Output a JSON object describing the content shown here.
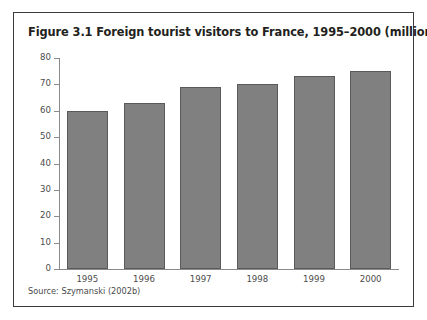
{
  "figure": {
    "title": "Figure 3.1 Foreign tourist visitors to France, 1995–2000 (millions)",
    "source": "Source: Szymanski (2002b)"
  },
  "chart_data": {
    "type": "bar",
    "title": "Figure 3.1 Foreign tourist visitors to France, 1995–2000 (millions)",
    "categories": [
      "1995",
      "1996",
      "1997",
      "1998",
      "1999",
      "2000"
    ],
    "values": [
      60,
      63,
      69,
      70,
      73,
      75
    ],
    "series": [
      {
        "name": "Foreign tourist visitors (millions)",
        "values": [
          60,
          63,
          69,
          70,
          73,
          75
        ]
      }
    ],
    "xlabel": "",
    "ylabel": "",
    "ylim": [
      0,
      80
    ],
    "yticks": [
      0,
      10,
      20,
      30,
      40,
      50,
      60,
      70,
      80
    ],
    "ytick_labels": [
      "0",
      "10",
      "20",
      "30",
      "40",
      "50",
      "60",
      "70",
      "80"
    ],
    "grid": false,
    "legend": false,
    "legend_position": "none",
    "bar_color": "#808080",
    "bar_border_color": "#5a5a5a",
    "axis_color": "#8a8a8a",
    "source": "Source: Szymanski (2002b)"
  }
}
